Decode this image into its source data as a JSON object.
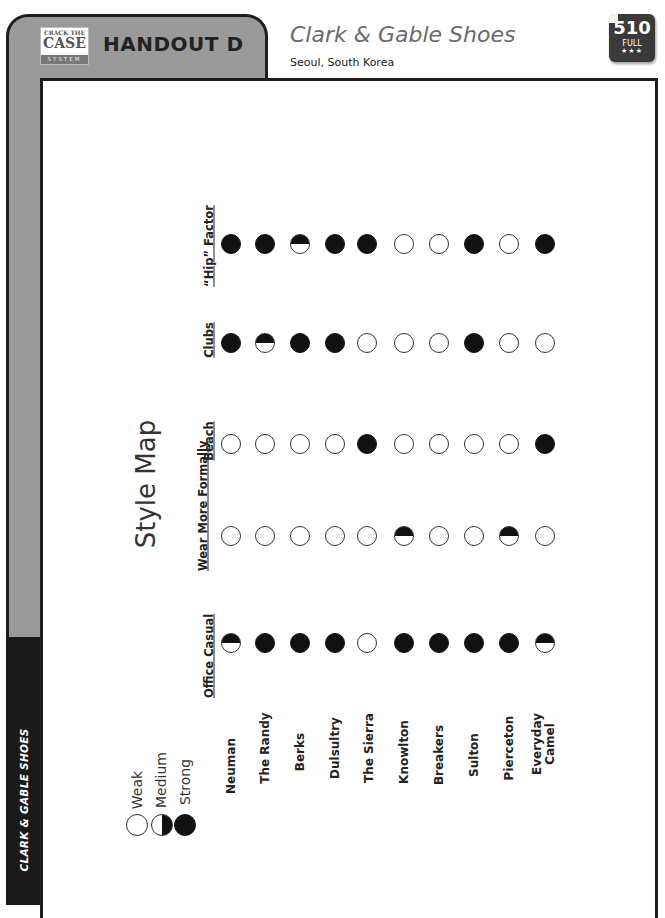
{
  "header": {
    "logo": {
      "line1": "CRACK THE",
      "line2": "CASE",
      "line3": "SYSTEM"
    },
    "handout_label": "HANDOUT D",
    "title": "Clark & Gable Shoes",
    "subtitle": "Seoul, South Korea",
    "badge": {
      "number": "510",
      "level": "FULL",
      "stars": "★★★"
    }
  },
  "side_label": "CLARK & GABLE SHOES",
  "style_map": {
    "title": "Style Map",
    "legend": [
      {
        "level": "weak",
        "label": "Weak"
      },
      {
        "level": "medium",
        "label": "Medium"
      },
      {
        "level": "strong",
        "label": "Strong"
      }
    ],
    "products": [
      "Neuman",
      "The Randy",
      "Berks",
      "Dulsultry",
      "The Sierra",
      "Knowlton",
      "Breakers",
      "Sulton",
      "Pierceton",
      "Everyday Camel"
    ],
    "categories": [
      {
        "label": "“Hip” Factor",
        "ratings": [
          "strong",
          "strong",
          "medium",
          "strong",
          "strong",
          "weak",
          "weak",
          "strong",
          "weak",
          "strong"
        ]
      },
      {
        "label": "Clubs",
        "ratings": [
          "strong",
          "medium",
          "strong",
          "strong",
          "weak",
          "weak",
          "weak",
          "strong",
          "weak",
          "weak"
        ]
      },
      {
        "label": "Beach",
        "ratings": [
          "weak",
          "weak",
          "weak",
          "weak",
          "strong",
          "weak",
          "weak",
          "weak",
          "weak",
          "strong"
        ]
      },
      {
        "label": "Wear More Formally",
        "ratings": [
          "weak",
          "weak",
          "weak",
          "weak",
          "weak",
          "medium",
          "weak",
          "weak",
          "medium",
          "weak"
        ]
      },
      {
        "label": "Office Casual",
        "ratings": [
          "medium",
          "strong",
          "strong",
          "strong",
          "weak",
          "strong",
          "strong",
          "strong",
          "strong",
          "medium"
        ]
      }
    ]
  },
  "chart_data": {
    "type": "table",
    "title": "Style Map",
    "columns": [
      "Neuman",
      "The Randy",
      "Berks",
      "Dulsultry",
      "The Sierra",
      "Knowlton",
      "Breakers",
      "Sulton",
      "Pierceton",
      "Everyday Camel"
    ],
    "rows": [
      "\"Hip\" Factor",
      "Clubs",
      "Beach",
      "Wear More Formally",
      "Office Casual"
    ],
    "scale": [
      "Weak",
      "Medium",
      "Strong"
    ],
    "values": [
      [
        "Strong",
        "Strong",
        "Medium",
        "Strong",
        "Strong",
        "Weak",
        "Weak",
        "Strong",
        "Weak",
        "Strong"
      ],
      [
        "Strong",
        "Medium",
        "Strong",
        "Strong",
        "Weak",
        "Weak",
        "Weak",
        "Strong",
        "Weak",
        "Weak"
      ],
      [
        "Weak",
        "Weak",
        "Weak",
        "Weak",
        "Strong",
        "Weak",
        "Weak",
        "Weak",
        "Weak",
        "Strong"
      ],
      [
        "Weak",
        "Weak",
        "Weak",
        "Weak",
        "Weak",
        "Medium",
        "Weak",
        "Weak",
        "Medium",
        "Weak"
      ],
      [
        "Medium",
        "Strong",
        "Strong",
        "Strong",
        "Weak",
        "Strong",
        "Strong",
        "Strong",
        "Strong",
        "Medium"
      ]
    ]
  }
}
